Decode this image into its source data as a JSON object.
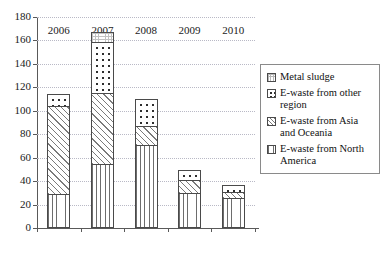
{
  "chart_data": {
    "type": "bar",
    "stacked": true,
    "title": "",
    "subtitle": "",
    "xlabel": "",
    "ylabel": "",
    "categories": [
      "2006",
      "2007",
      "2008",
      "2009",
      "2010"
    ],
    "ylim": [
      0,
      180
    ],
    "yticks": [
      0,
      20,
      40,
      60,
      80,
      100,
      120,
      140,
      160,
      180
    ],
    "ytick_labels": [
      "0",
      "20",
      "40",
      "60",
      "80",
      "100",
      "120",
      "140",
      "160",
      "180"
    ],
    "grid": "horizontal-dotted",
    "legend_position": "right",
    "series": [
      {
        "name": "E-waste from North America",
        "pattern": "vertical-lines",
        "values": [
          29,
          55,
          71,
          30,
          26
        ]
      },
      {
        "name": "E-waste from Asia and Oceania",
        "pattern": "diagonal-hatch",
        "values": [
          76,
          61,
          17,
          12,
          6
        ]
      },
      {
        "name": "E-waste from other region",
        "pattern": "dots",
        "values": [
          11,
          44,
          24,
          9,
          6
        ]
      },
      {
        "name": "Metal sludge",
        "pattern": "fine-grid",
        "values": [
          0,
          10,
          0,
          0,
          0
        ]
      }
    ],
    "stack_totals": [
      116,
      170,
      112,
      51,
      38
    ],
    "stack_order_bottom_to_top": [
      "E-waste from North America",
      "E-waste from Asia and Oceania",
      "E-waste from other region",
      "Metal sludge"
    ]
  },
  "legend": {
    "entries": [
      {
        "label": "Metal sludge",
        "pattern": "fine-grid"
      },
      {
        "label": "E-waste from other region",
        "pattern": "dots"
      },
      {
        "label": "E-waste from Asia and Oceania",
        "pattern": "diagonal-hatch"
      },
      {
        "label": "E-waste from North America",
        "pattern": "vertical-lines"
      }
    ]
  },
  "colors": {
    "axis": "#595959",
    "gridline": "#b9b9c6",
    "bar_outline": "#4a4a4a",
    "text": "#1a1a1a",
    "background": "#ffffff"
  }
}
